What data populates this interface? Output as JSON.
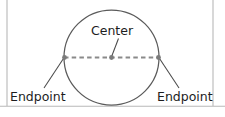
{
  "figure": {
    "background_color": "#ffffff",
    "width": 225,
    "height": 117
  },
  "labels": {
    "center": "Center",
    "endpoint_left": "Endpoint",
    "endpoint_right": "Endpoint"
  },
  "colors": {
    "circle_stroke": "#5a5a5a",
    "diameter_stroke": "#8a8a8a",
    "leader_stroke": "#4a4a4a",
    "point_fill": "#7b7b7b",
    "text": "#1d1d1d",
    "border": "#b8b8b8"
  },
  "geometry": {
    "circle": {
      "center_x": 111.5,
      "center_y": 57.5,
      "radius": 47.5
    },
    "diameter": {
      "x1": 64,
      "y1": 57.5,
      "x2": 159,
      "y2": 57.5,
      "dash_pattern": "4.5,3.2"
    },
    "points": [
      {
        "name": "left-endpoint",
        "cx": 64.5,
        "cy": 57.5,
        "r": 2.4
      },
      {
        "name": "center-point",
        "cx": 111.5,
        "cy": 57.5,
        "r": 2.4
      },
      {
        "name": "right-endpoint",
        "cx": 158.5,
        "cy": 57.5,
        "r": 2.4
      }
    ],
    "leaders": [
      {
        "name": "center-leader",
        "x1": 118.5,
        "y1": 38.5,
        "x2": 111.8,
        "y2": 56.0
      },
      {
        "name": "endpoint-left-leader",
        "x1": 44.0,
        "y1": 88.0,
        "x2": 63.5,
        "y2": 58.5
      },
      {
        "name": "endpoint-right-leader",
        "x1": 179.0,
        "y1": 88.0,
        "x2": 159.5,
        "y2": 58.5
      }
    ],
    "label_positions": {
      "center": {
        "x": 91,
        "y": 35
      },
      "endpoint_left": {
        "x": 10,
        "y": 101
      },
      "endpoint_right": {
        "x": 157,
        "y": 101
      }
    },
    "borders": {
      "left_x": 7,
      "right_x": 213,
      "bottom_y": 106,
      "left_top": 0,
      "left_bottom": 106,
      "right_top": 0,
      "right_bottom": 106
    }
  }
}
